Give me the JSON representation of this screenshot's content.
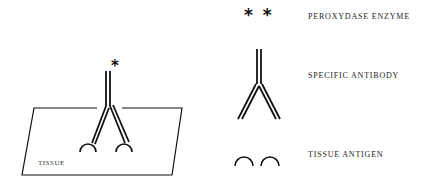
{
  "diagram": {
    "scene": {
      "tissue_label": "TISSUE",
      "enzyme_marker": "*"
    },
    "legend": [
      {
        "symbol": "peroxydase-enzyme",
        "glyph": "* *",
        "label": "PEROXYDASE ENZYME"
      },
      {
        "symbol": "specific-antibody",
        "label": "SPECIFIC ANTIBODY"
      },
      {
        "symbol": "tissue-antigen",
        "label": "TISSUE ANTIGEN"
      }
    ],
    "colors": {
      "ink": "#111111",
      "background": "#ffffff"
    }
  }
}
